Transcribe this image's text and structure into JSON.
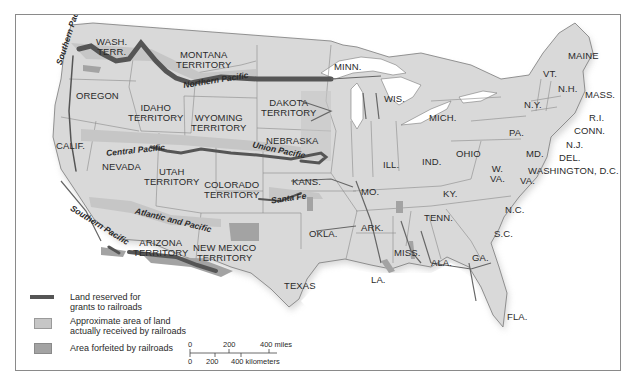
{
  "map": {
    "title": "Railroad Land Grants",
    "colors": {
      "land": "#d9d9d9",
      "water": "#ffffff",
      "border": "#7a7a7a",
      "grant_line": "#555555",
      "received_area": "#c6c6c6",
      "forfeited_area": "#a3a3a3"
    },
    "state_labels": [
      {
        "id": "wash",
        "text": "WASH.\nTERR."
      },
      {
        "id": "montana",
        "text": "MONTANA\nTERRITORY"
      },
      {
        "id": "minn",
        "text": "MINN."
      },
      {
        "id": "oregon",
        "text": "OREGON"
      },
      {
        "id": "idaho",
        "text": "IDAHO\nTERRITORY"
      },
      {
        "id": "wyoming",
        "text": "WYOMING\nTERRITORY"
      },
      {
        "id": "dakota",
        "text": "DAKOTA\nTERRITORY"
      },
      {
        "id": "wis",
        "text": "WIS."
      },
      {
        "id": "mich",
        "text": "MICH."
      },
      {
        "id": "maine",
        "text": "MAINE"
      },
      {
        "id": "vt",
        "text": "VT."
      },
      {
        "id": "nh",
        "text": "N.H."
      },
      {
        "id": "mass",
        "text": "MASS."
      },
      {
        "id": "ny",
        "text": "N.Y."
      },
      {
        "id": "ri",
        "text": "R.I."
      },
      {
        "id": "conn",
        "text": "CONN."
      },
      {
        "id": "pa",
        "text": "PA."
      },
      {
        "id": "nj",
        "text": "N.J."
      },
      {
        "id": "del",
        "text": "DEL."
      },
      {
        "id": "md",
        "text": "MD."
      },
      {
        "id": "dc",
        "text": "WASHINGTON, D.C."
      },
      {
        "id": "calif",
        "text": "CALIF."
      },
      {
        "id": "nevada",
        "text": "NEVADA"
      },
      {
        "id": "utah",
        "text": "UTAH\nTERRITORY"
      },
      {
        "id": "nebraska",
        "text": "NEBRASKA"
      },
      {
        "id": "colorado",
        "text": "COLORADO\nTERRITORY"
      },
      {
        "id": "kans",
        "text": "KANS."
      },
      {
        "id": "ill",
        "text": "ILL."
      },
      {
        "id": "ind",
        "text": "IND."
      },
      {
        "id": "ohio",
        "text": "OHIO"
      },
      {
        "id": "wva",
        "text": "W.\nVA."
      },
      {
        "id": "va",
        "text": "VA."
      },
      {
        "id": "mo",
        "text": "MO."
      },
      {
        "id": "ky",
        "text": "KY."
      },
      {
        "id": "nc",
        "text": "N.C."
      },
      {
        "id": "tenn",
        "text": "TENN."
      },
      {
        "id": "okla",
        "text": "OKLA."
      },
      {
        "id": "ark",
        "text": "ARK."
      },
      {
        "id": "sc",
        "text": "S.C."
      },
      {
        "id": "arizona",
        "text": "ARIZONA\nTERRITORY"
      },
      {
        "id": "newmexico",
        "text": "NEW MEXICO\nTERRITORY"
      },
      {
        "id": "miss",
        "text": "MISS."
      },
      {
        "id": "ala",
        "text": "ALA."
      },
      {
        "id": "ga",
        "text": "GA."
      },
      {
        "id": "texas",
        "text": "TEXAS"
      },
      {
        "id": "la",
        "text": "LA."
      },
      {
        "id": "fla",
        "text": "FLA."
      }
    ],
    "railroad_labels": [
      {
        "id": "southern_pacific_north",
        "text": "Southern Pacific"
      },
      {
        "id": "northern_pacific",
        "text": "Northern Pacific"
      },
      {
        "id": "central_pacific",
        "text": "Central Pacific"
      },
      {
        "id": "union_pacific",
        "text": "Union Pacific"
      },
      {
        "id": "santa_fe",
        "text": "Santa Fe"
      },
      {
        "id": "southern_pacific_south",
        "text": "Southern Pacific"
      },
      {
        "id": "atlantic_pacific",
        "text": "Atlantic and Pacific"
      }
    ]
  },
  "legend": {
    "items": [
      {
        "swatch": "thick-line",
        "label_line1": "Land reserved for",
        "label_line2": "grants to railroads"
      },
      {
        "swatch": "light-box",
        "label_line1": "Approximate area of land",
        "label_line2": "actually received by railroads"
      },
      {
        "swatch": "dark-box",
        "label_line1": "Area forfeited by railroads",
        "label_line2": ""
      }
    ]
  },
  "scale_bar": {
    "miles": {
      "ticks": [
        "0",
        "200",
        "400 miles"
      ]
    },
    "kilometers": {
      "ticks": [
        "0",
        "200",
        "400 kilometers"
      ]
    }
  }
}
